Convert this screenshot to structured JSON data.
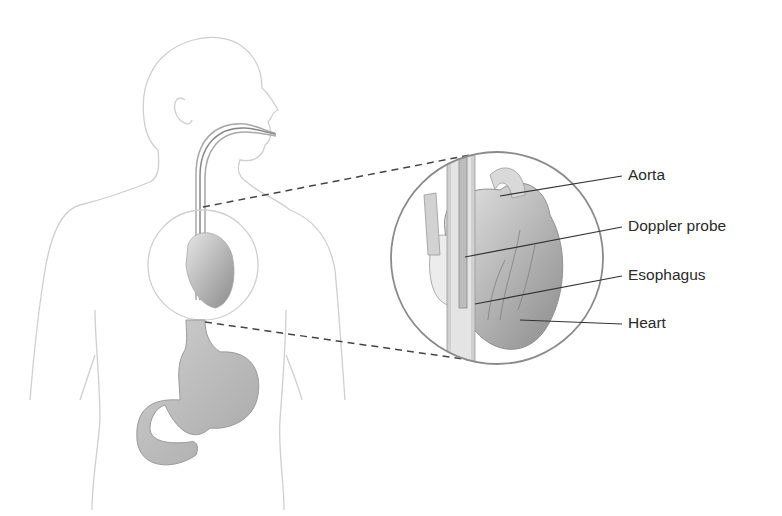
{
  "diagram": {
    "labels": [
      {
        "id": "aorta",
        "text": "Aorta"
      },
      {
        "id": "doppler-probe",
        "text": "Doppler probe"
      },
      {
        "id": "esophagus",
        "text": "Esophagus"
      },
      {
        "id": "heart",
        "text": "Heart"
      }
    ],
    "colors": {
      "outline": "#c8c8c8",
      "organ_fill": "#b9b9b9",
      "heart_fill": "#9d9d9d",
      "leader": "#333333",
      "magnifier_ring": "#8a8a8a"
    }
  }
}
